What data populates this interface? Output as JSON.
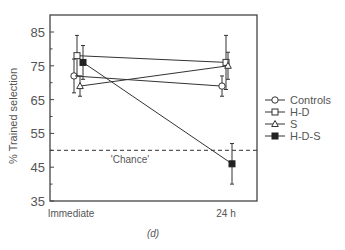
{
  "chart_data": {
    "type": "line",
    "title": "",
    "panel_label": "(d)",
    "xlabel": "",
    "ylabel": "% Trained selection",
    "categories": [
      "Immediate",
      "24 h"
    ],
    "ylim": [
      35,
      90
    ],
    "yticks": [
      35,
      45,
      55,
      65,
      75,
      85
    ],
    "grid": false,
    "legend_position": "right",
    "reference_line": {
      "y": 50,
      "label": "'Chance'",
      "style": "dashed"
    },
    "series": [
      {
        "name": "Controls",
        "marker": "open-circle",
        "values": [
          72,
          69
        ],
        "errors": [
          5,
          3
        ]
      },
      {
        "name": "H-D",
        "marker": "open-square",
        "values": [
          78,
          76
        ],
        "errors": [
          6,
          8
        ]
      },
      {
        "name": "S",
        "marker": "open-triangle",
        "values": [
          69,
          75
        ],
        "errors": [
          3,
          4
        ]
      },
      {
        "name": "H-D-S",
        "marker": "filled-square",
        "values": [
          76,
          46
        ],
        "errors": [
          5,
          6
        ]
      }
    ]
  }
}
